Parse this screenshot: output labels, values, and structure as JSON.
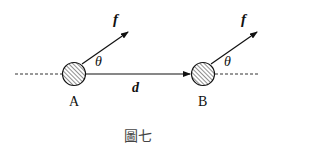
{
  "diagram": {
    "caption": "圖七",
    "points": [
      {
        "label": "A",
        "force_label": "f",
        "angle_label": "θ"
      },
      {
        "label": "B",
        "force_label": "f",
        "angle_label": "θ"
      }
    ],
    "displacement_label": "d",
    "colors": {
      "stroke": "#111111",
      "background": "#ffffff"
    }
  }
}
